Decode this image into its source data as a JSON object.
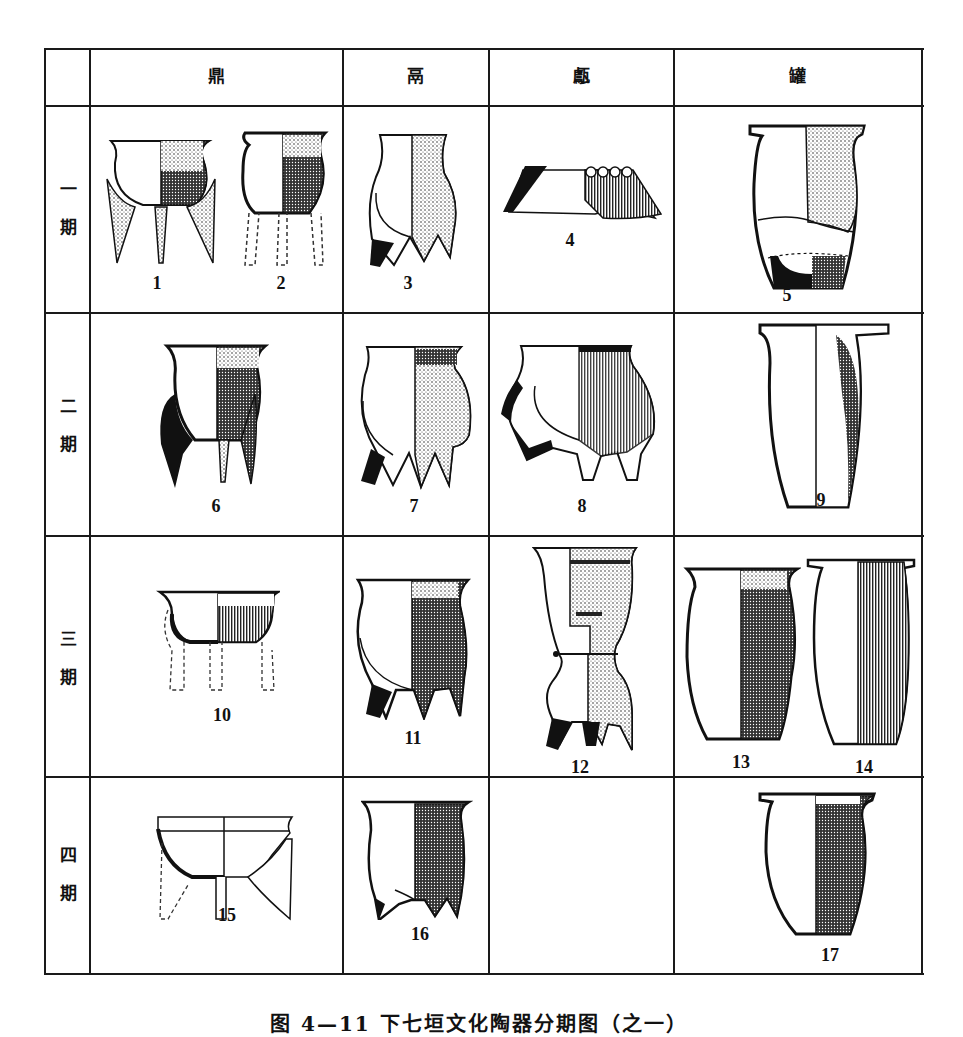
{
  "figure": {
    "caption": "图 4—11  下七垣文化陶器分期图（之一）",
    "columns": [
      {
        "id": "ding",
        "label": "鼎"
      },
      {
        "id": "li",
        "label": "鬲"
      },
      {
        "id": "yan",
        "label": "甗"
      },
      {
        "id": "guan",
        "label": "罐"
      }
    ],
    "periods": [
      {
        "label_top": "一",
        "label_bottom": "期"
      },
      {
        "label_top": "二",
        "label_bottom": "期"
      },
      {
        "label_top": "三",
        "label_bottom": "期"
      },
      {
        "label_top": "四",
        "label_bottom": "期"
      }
    ],
    "items": [
      {
        "num": "1",
        "type": "鼎",
        "period": "一期"
      },
      {
        "num": "2",
        "type": "鼎",
        "period": "一期"
      },
      {
        "num": "3",
        "type": "鬲",
        "period": "一期"
      },
      {
        "num": "4",
        "type": "甗",
        "period": "一期"
      },
      {
        "num": "5",
        "type": "罐",
        "period": "一期"
      },
      {
        "num": "6",
        "type": "鼎",
        "period": "二期"
      },
      {
        "num": "7",
        "type": "鬲",
        "period": "二期"
      },
      {
        "num": "8",
        "type": "甗",
        "period": "二期"
      },
      {
        "num": "9",
        "type": "罐",
        "period": "二期"
      },
      {
        "num": "10",
        "type": "鼎",
        "period": "三期"
      },
      {
        "num": "11",
        "type": "鬲",
        "period": "三期"
      },
      {
        "num": "12",
        "type": "甗",
        "period": "三期"
      },
      {
        "num": "13",
        "type": "罐",
        "period": "三期"
      },
      {
        "num": "14",
        "type": "罐",
        "period": "三期"
      },
      {
        "num": "15",
        "type": "鼎",
        "period": "四期"
      },
      {
        "num": "16",
        "type": "鬲",
        "period": "四期"
      },
      {
        "num": "17",
        "type": "罐",
        "period": "四期"
      }
    ],
    "colors": {
      "ink": "#1a1a1a",
      "paper": "#ffffff",
      "shade": "#555555"
    }
  }
}
